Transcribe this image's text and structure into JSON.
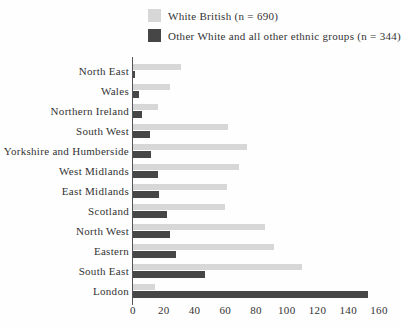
{
  "chart_data": {
    "type": "bar",
    "orientation": "horizontal",
    "title": "",
    "xlabel": "",
    "ylabel": "",
    "grid": false,
    "legend_position": "top",
    "xlim": [
      0,
      160
    ],
    "xticks": [
      0,
      20,
      40,
      60,
      80,
      100,
      120,
      140,
      160
    ],
    "categories": [
      "North East",
      "Wales",
      "Northern Ireland",
      "South West",
      "Yorkshire and Humberside",
      "West Midlands",
      "East Midlands",
      "Scotland",
      "North West",
      "Eastern",
      "South East",
      "London"
    ],
    "series": [
      {
        "name": "White British (n = 690)",
        "color": "#d7d7d7",
        "values": [
          31,
          24,
          16,
          62,
          74,
          69,
          61,
          60,
          86,
          92,
          110,
          14
        ]
      },
      {
        "name": "Other White and all other ethnic groups (n = 344)",
        "color": "#464646",
        "values": [
          1,
          4,
          6,
          11,
          12,
          16,
          17,
          22,
          24,
          28,
          47,
          153
        ]
      }
    ]
  }
}
